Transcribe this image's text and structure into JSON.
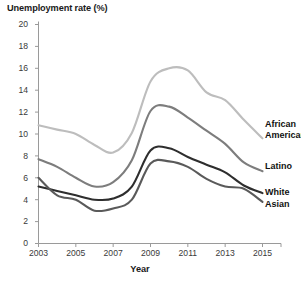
{
  "chart_data": {
    "type": "line",
    "title": "Unemployment rate (%)",
    "xlabel": "Year",
    "ylabel": "Unemployment rate (%)",
    "xlim": [
      2003,
      2015.6
    ],
    "ylim": [
      0,
      20
    ],
    "grid": false,
    "legend_position": "right-inline-labels",
    "xticks": [
      "2003",
      "2005",
      "2007",
      "2009",
      "2011",
      "2013",
      "2015"
    ],
    "xtick_values": [
      2003,
      2005,
      2007,
      2009,
      2011,
      2013,
      2015
    ],
    "yticks": [
      "0",
      "2",
      "4",
      "6",
      "8",
      "10",
      "12",
      "14",
      "16",
      "18",
      "20"
    ],
    "ytick_values": [
      0,
      2,
      4,
      6,
      8,
      10,
      12,
      14,
      16,
      18,
      20
    ],
    "x": [
      2003,
      2004,
      2005,
      2006,
      2007,
      2008,
      2009,
      2010,
      2011,
      2012,
      2013,
      2014,
      2015
    ],
    "series": [
      {
        "name": "African American",
        "color": "#bdbdbd",
        "values": [
          10.8,
          10.4,
          10.0,
          9.0,
          8.3,
          10.1,
          14.8,
          16.0,
          15.8,
          13.8,
          13.1,
          11.3,
          9.6
        ]
      },
      {
        "name": "Latino",
        "color": "#7d7d7d",
        "values": [
          7.7,
          7.0,
          6.0,
          5.2,
          5.6,
          7.6,
          12.1,
          12.5,
          11.5,
          10.3,
          9.1,
          7.4,
          6.6
        ]
      },
      {
        "name": "White",
        "color": "#2e2e2e",
        "values": [
          5.2,
          4.8,
          4.4,
          4.0,
          4.1,
          5.2,
          8.5,
          8.7,
          7.9,
          7.2,
          6.5,
          5.3,
          4.6
        ]
      },
      {
        "name": "Asian",
        "color": "#5a5a5a",
        "values": [
          6.0,
          4.4,
          4.0,
          3.0,
          3.2,
          4.0,
          7.3,
          7.5,
          7.0,
          5.9,
          5.2,
          5.0,
          3.8
        ]
      }
    ]
  },
  "axis": {
    "y_labels": [
      "20",
      "18",
      "16",
      "14",
      "12",
      "10",
      "8",
      "6",
      "4",
      "2",
      "0"
    ],
    "x_labels": [
      "2003",
      "2005",
      "2007",
      "2009",
      "2011",
      "2013",
      "2015"
    ],
    "x_title": "Year"
  },
  "series_labels": [
    {
      "line1": "African",
      "line2": "American"
    },
    {
      "line1": "Latino",
      "line2": ""
    },
    {
      "line1": "White",
      "line2": ""
    },
    {
      "line1": "Asian",
      "line2": ""
    }
  ],
  "title": "Unemployment rate (%)",
  "colors": {
    "african_american": "#bdbdbd",
    "latino": "#7d7d7d",
    "white": "#2e2e2e",
    "asian": "#5a5a5a",
    "axis": "#9a9a9a",
    "text": "#231f20"
  }
}
